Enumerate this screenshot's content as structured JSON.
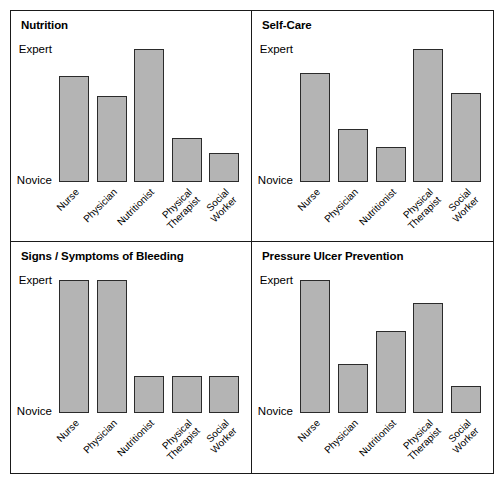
{
  "figure": {
    "axis": {
      "top_label": "Expert",
      "bottom_label": "Novice"
    },
    "categories": [
      "Nurse",
      "Physician",
      "Nutritionist",
      "Physical\nTherapist",
      "Social\nWorker"
    ],
    "bar_fill_color": "#b4b4b4",
    "bar_border_color": "#2b2b2b",
    "panels": [
      {
        "title": "Nutrition",
        "values": [
          80,
          65,
          100,
          33,
          22
        ]
      },
      {
        "title": "Self-Care",
        "values": [
          82,
          40,
          26,
          100,
          67
        ]
      },
      {
        "title": "Signs / Symptoms of Bleeding",
        "values": [
          100,
          100,
          28,
          28,
          28
        ]
      },
      {
        "title": "Pressure Ulcer Prevention",
        "values": [
          100,
          37,
          62,
          83,
          20
        ]
      }
    ]
  },
  "chart_data": {
    "type": "bar",
    "title": "",
    "xlabel": "",
    "ylabel": "",
    "ylim": [
      0,
      100
    ],
    "ytick_labels": [
      "Novice",
      "Expert"
    ],
    "grid": false,
    "legend": "none",
    "categories": [
      "Nurse",
      "Physician",
      "Nutritionist",
      "Physical Therapist",
      "Social Worker"
    ],
    "panels": [
      {
        "title": "Nutrition",
        "categories": [
          "Nurse",
          "Physician",
          "Nutritionist",
          "Physical Therapist",
          "Social Worker"
        ],
        "values": [
          80,
          65,
          100,
          33,
          22
        ]
      },
      {
        "title": "Self-Care",
        "categories": [
          "Nurse",
          "Physician",
          "Nutritionist",
          "Physical Therapist",
          "Social Worker"
        ],
        "values": [
          82,
          40,
          26,
          100,
          67
        ]
      },
      {
        "title": "Signs / Symptoms of Bleeding",
        "categories": [
          "Nurse",
          "Physician",
          "Nutritionist",
          "Physical Therapist",
          "Social Worker"
        ],
        "values": [
          100,
          100,
          28,
          28,
          28
        ]
      },
      {
        "title": "Pressure Ulcer Prevention",
        "categories": [
          "Nurse",
          "Physician",
          "Nutritionist",
          "Physical Therapist",
          "Social Worker"
        ],
        "values": [
          100,
          37,
          62,
          83,
          20
        ]
      }
    ]
  }
}
